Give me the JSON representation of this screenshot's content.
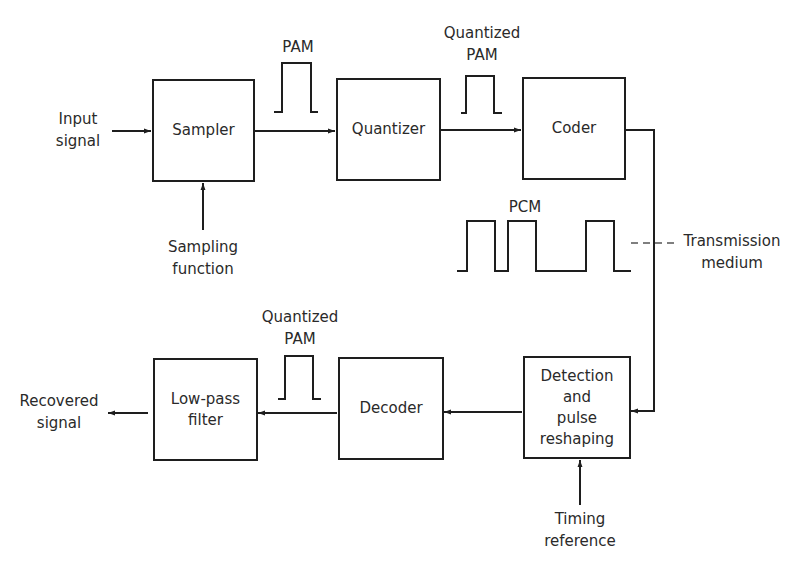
{
  "diagram": {
    "type": "PCM transmission system block diagram",
    "blocks": [
      {
        "id": "sampler",
        "label": "Sampler"
      },
      {
        "id": "quantizer",
        "label": "Quantizer"
      },
      {
        "id": "coder",
        "label": "Coder"
      },
      {
        "id": "detection",
        "label": "Detection\nand\npulse\nreshaping"
      },
      {
        "id": "decoder",
        "label": "Decoder"
      },
      {
        "id": "lowpass",
        "label": "Low-pass\nfilter"
      }
    ],
    "labels": {
      "input_signal": "Input\nsignal",
      "sampling_function": "Sampling\nfunction",
      "pam": "PAM",
      "quantized_pam_top": "Quantized\nPAM",
      "pcm": "PCM",
      "transmission_medium": "Transmission\nmedium",
      "quantized_pam_bottom": "Quantized\nPAM",
      "timing_reference": "Timing\nreference",
      "recovered_signal": "Recovered\nsignal"
    },
    "connections": [
      {
        "from": "input_signal",
        "to": "sampler"
      },
      {
        "from": "sampling_function",
        "to": "sampler"
      },
      {
        "from": "sampler",
        "to": "quantizer",
        "signal": "PAM"
      },
      {
        "from": "quantizer",
        "to": "coder",
        "signal": "Quantized PAM"
      },
      {
        "from": "coder",
        "to": "detection",
        "signal": "PCM",
        "via": "Transmission medium"
      },
      {
        "from": "timing_reference",
        "to": "detection"
      },
      {
        "from": "detection",
        "to": "decoder"
      },
      {
        "from": "decoder",
        "to": "lowpass",
        "signal": "Quantized PAM"
      },
      {
        "from": "lowpass",
        "to": "recovered_signal"
      }
    ],
    "line_color": "#1e1e1e",
    "dash_color": "#555555"
  }
}
